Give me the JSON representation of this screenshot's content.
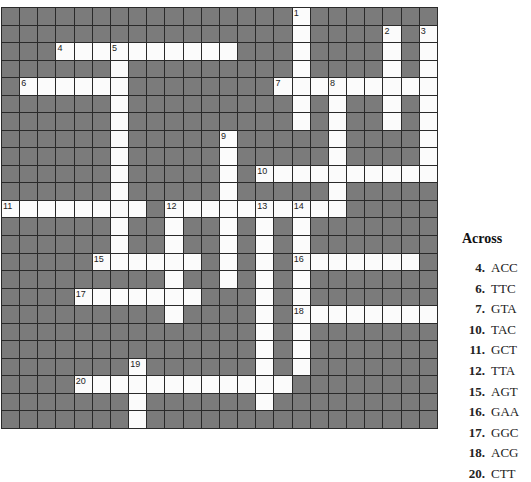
{
  "puzzle": {
    "rows": 24,
    "cols": 24,
    "open_cells": [
      [
        0,
        16
      ],
      [
        1,
        16
      ],
      [
        1,
        21
      ],
      [
        1,
        23
      ],
      [
        2,
        3
      ],
      [
        2,
        4
      ],
      [
        2,
        5
      ],
      [
        2,
        6
      ],
      [
        2,
        7
      ],
      [
        2,
        8
      ],
      [
        2,
        9
      ],
      [
        2,
        10
      ],
      [
        2,
        11
      ],
      [
        2,
        12
      ],
      [
        2,
        16
      ],
      [
        2,
        21
      ],
      [
        2,
        23
      ],
      [
        3,
        6
      ],
      [
        3,
        16
      ],
      [
        3,
        21
      ],
      [
        3,
        23
      ],
      [
        4,
        1
      ],
      [
        4,
        2
      ],
      [
        4,
        3
      ],
      [
        4,
        4
      ],
      [
        4,
        5
      ],
      [
        4,
        6
      ],
      [
        4,
        15
      ],
      [
        4,
        16
      ],
      [
        4,
        17
      ],
      [
        4,
        18
      ],
      [
        4,
        19
      ],
      [
        4,
        20
      ],
      [
        4,
        21
      ],
      [
        4,
        22
      ],
      [
        4,
        23
      ],
      [
        5,
        6
      ],
      [
        5,
        16
      ],
      [
        5,
        18
      ],
      [
        5,
        21
      ],
      [
        5,
        23
      ],
      [
        6,
        6
      ],
      [
        6,
        16
      ],
      [
        6,
        18
      ],
      [
        6,
        21
      ],
      [
        6,
        23
      ],
      [
        7,
        6
      ],
      [
        7,
        12
      ],
      [
        7,
        18
      ],
      [
        7,
        23
      ],
      [
        8,
        6
      ],
      [
        8,
        12
      ],
      [
        8,
        18
      ],
      [
        8,
        23
      ],
      [
        9,
        6
      ],
      [
        9,
        12
      ],
      [
        9,
        14
      ],
      [
        9,
        15
      ],
      [
        9,
        16
      ],
      [
        9,
        17
      ],
      [
        9,
        18
      ],
      [
        9,
        19
      ],
      [
        9,
        20
      ],
      [
        9,
        21
      ],
      [
        9,
        22
      ],
      [
        9,
        23
      ],
      [
        10,
        6
      ],
      [
        10,
        12
      ],
      [
        10,
        18
      ],
      [
        11,
        0
      ],
      [
        11,
        1
      ],
      [
        11,
        2
      ],
      [
        11,
        3
      ],
      [
        11,
        4
      ],
      [
        11,
        5
      ],
      [
        11,
        6
      ],
      [
        11,
        7
      ],
      [
        11,
        9
      ],
      [
        11,
        10
      ],
      [
        11,
        11
      ],
      [
        11,
        12
      ],
      [
        11,
        13
      ],
      [
        11,
        14
      ],
      [
        11,
        15
      ],
      [
        11,
        16
      ],
      [
        11,
        17
      ],
      [
        11,
        18
      ],
      [
        12,
        6
      ],
      [
        12,
        9
      ],
      [
        12,
        12
      ],
      [
        12,
        14
      ],
      [
        12,
        16
      ],
      [
        13,
        6
      ],
      [
        13,
        9
      ],
      [
        13,
        12
      ],
      [
        13,
        14
      ],
      [
        13,
        16
      ],
      [
        14,
        5
      ],
      [
        14,
        6
      ],
      [
        14,
        7
      ],
      [
        14,
        8
      ],
      [
        14,
        9
      ],
      [
        14,
        10
      ],
      [
        14,
        12
      ],
      [
        14,
        14
      ],
      [
        14,
        16
      ],
      [
        14,
        17
      ],
      [
        14,
        18
      ],
      [
        14,
        19
      ],
      [
        14,
        20
      ],
      [
        14,
        21
      ],
      [
        14,
        22
      ],
      [
        15,
        9
      ],
      [
        15,
        12
      ],
      [
        15,
        14
      ],
      [
        15,
        16
      ],
      [
        16,
        4
      ],
      [
        16,
        5
      ],
      [
        16,
        6
      ],
      [
        16,
        7
      ],
      [
        16,
        8
      ],
      [
        16,
        9
      ],
      [
        16,
        10
      ],
      [
        16,
        14
      ],
      [
        16,
        16
      ],
      [
        17,
        9
      ],
      [
        17,
        14
      ],
      [
        17,
        16
      ],
      [
        17,
        17
      ],
      [
        17,
        18
      ],
      [
        17,
        19
      ],
      [
        17,
        20
      ],
      [
        17,
        21
      ],
      [
        17,
        22
      ],
      [
        17,
        23
      ],
      [
        18,
        14
      ],
      [
        18,
        16
      ],
      [
        19,
        14
      ],
      [
        19,
        16
      ],
      [
        20,
        7
      ],
      [
        20,
        14
      ],
      [
        20,
        16
      ],
      [
        21,
        4
      ],
      [
        21,
        5
      ],
      [
        21,
        6
      ],
      [
        21,
        7
      ],
      [
        21,
        8
      ],
      [
        21,
        9
      ],
      [
        21,
        10
      ],
      [
        21,
        11
      ],
      [
        21,
        12
      ],
      [
        21,
        13
      ],
      [
        21,
        14
      ],
      [
        21,
        15
      ],
      [
        22,
        7
      ],
      [
        22,
        14
      ],
      [
        23,
        7
      ]
    ],
    "numbers": [
      {
        "n": "1",
        "r": 0,
        "c": 16
      },
      {
        "n": "2",
        "r": 1,
        "c": 21
      },
      {
        "n": "3",
        "r": 1,
        "c": 23
      },
      {
        "n": "4",
        "r": 2,
        "c": 3
      },
      {
        "n": "5",
        "r": 2,
        "c": 6
      },
      {
        "n": "6",
        "r": 4,
        "c": 1
      },
      {
        "n": "7",
        "r": 4,
        "c": 15
      },
      {
        "n": "8",
        "r": 4,
        "c": 18
      },
      {
        "n": "9",
        "r": 7,
        "c": 12
      },
      {
        "n": "10",
        "r": 9,
        "c": 14
      },
      {
        "n": "11",
        "r": 11,
        "c": 0
      },
      {
        "n": "12",
        "r": 11,
        "c": 9
      },
      {
        "n": "13",
        "r": 11,
        "c": 14
      },
      {
        "n": "14",
        "r": 11,
        "c": 16
      },
      {
        "n": "15",
        "r": 14,
        "c": 5
      },
      {
        "n": "16",
        "r": 14,
        "c": 16
      },
      {
        "n": "17",
        "r": 16,
        "c": 4
      },
      {
        "n": "18",
        "r": 17,
        "c": 16
      },
      {
        "n": "19",
        "r": 20,
        "c": 7
      },
      {
        "n": "20",
        "r": 21,
        "c": 4
      }
    ],
    "colors": {
      "block": "#7b7b7b",
      "open": "#fbfbfb",
      "grid_line": "#2a2a2a"
    }
  },
  "clues": {
    "heading": "Across",
    "across": [
      {
        "number": "4.",
        "text": "ACC"
      },
      {
        "number": "6.",
        "text": "TTC"
      },
      {
        "number": "7.",
        "text": "GTA"
      },
      {
        "number": "10.",
        "text": "TAC"
      },
      {
        "number": "11.",
        "text": "GCT"
      },
      {
        "number": "12.",
        "text": "TTA"
      },
      {
        "number": "15.",
        "text": "AGT"
      },
      {
        "number": "16.",
        "text": "GAA"
      },
      {
        "number": "17.",
        "text": "GGC"
      },
      {
        "number": "18.",
        "text": "ACG"
      },
      {
        "number": "20.",
        "text": "CTT"
      }
    ]
  }
}
